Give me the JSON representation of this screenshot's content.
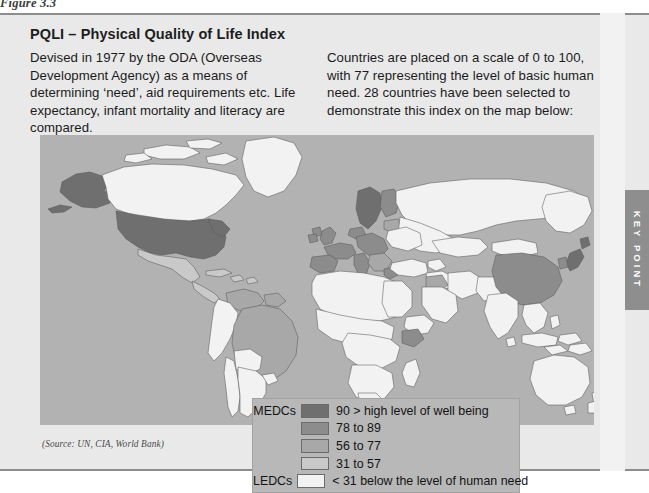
{
  "figure": {
    "caption": "Figure 3.3"
  },
  "panel": {
    "title": "PQLI – Physical Quality of Life Index",
    "left_column": "Devised in 1977 by the ODA (Overseas Development Agency) as a means of determining ‘need’, aid requirements etc. Life expectancy, infant mortality and literacy are compared.",
    "right_column": "Countries are placed on a scale of 0 to 100, with 77 representing the level of basic human need. 28 countries have been selected to demonstrate this index on the map below:",
    "source": "(Source: UN, CIA, World Bank)"
  },
  "legend": {
    "rows": [
      {
        "category": "MEDCs",
        "label": "90 > high level of well being",
        "color": "#6f6f6f"
      },
      {
        "category": "",
        "label": "78 to 89",
        "color": "#8c8c8c"
      },
      {
        "category": "",
        "label": "56 to 77",
        "color": "#a8a8a8"
      },
      {
        "category": "",
        "label": "31 to 57",
        "color": "#c9c9c9"
      },
      {
        "category": "LEDCs",
        "label": "< 31 below the level of human need",
        "color": "#f2f2f2"
      }
    ]
  },
  "key_point_tab": {
    "label": "KEY POINT"
  },
  "colors": {
    "panel_background": "#e9e9e9",
    "map_ocean": "#b2b2b2",
    "legend_background": "#b8b8b8",
    "tab_background": "#8e8e8e",
    "class_90_plus": "#6f6f6f",
    "class_78_89": "#8c8c8c",
    "class_56_77": "#a8a8a8",
    "class_31_57": "#c9c9c9",
    "class_under_31": "#f2f2f2"
  }
}
